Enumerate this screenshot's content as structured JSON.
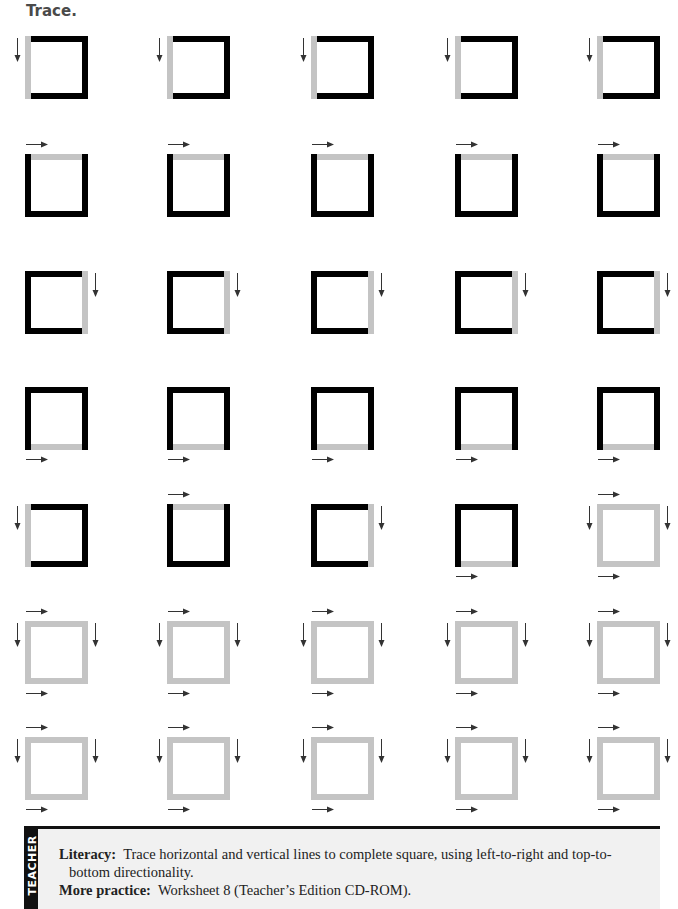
{
  "worksheet": {
    "title": "Trace."
  },
  "colors": {
    "solid_line": "#000000",
    "trace_line": "#c4c4c4",
    "teacher_panel": "#f1f1f1"
  },
  "grid": {
    "columns_x": [
      25,
      167,
      311,
      455,
      597
    ],
    "rows_y": [
      36,
      154,
      271,
      387,
      504,
      621,
      737
    ],
    "rows": [
      {
        "trace_sides": [
          "left"
        ],
        "arrows": [
          "left"
        ]
      },
      {
        "trace_sides": [
          "top"
        ],
        "arrows": [
          "top"
        ]
      },
      {
        "trace_sides": [
          "right"
        ],
        "arrows": [
          "right"
        ]
      },
      {
        "trace_sides": [
          "bottom"
        ],
        "arrows": [
          "bottom"
        ]
      },
      {
        "mixed": [
          {
            "trace_sides": [
              "left"
            ],
            "arrows": [
              "left"
            ]
          },
          {
            "trace_sides": [
              "top"
            ],
            "arrows": [
              "top"
            ]
          },
          {
            "trace_sides": [
              "right"
            ],
            "arrows": [
              "right"
            ]
          },
          {
            "trace_sides": [
              "bottom"
            ],
            "arrows": [
              "bottom"
            ]
          },
          {
            "trace_sides": [
              "top",
              "left",
              "right",
              "bottom"
            ],
            "arrows": [
              "top",
              "left",
              "right",
              "bottom"
            ]
          }
        ]
      },
      {
        "trace_sides": [
          "top",
          "left",
          "right",
          "bottom"
        ],
        "arrows": [
          "top",
          "left",
          "right",
          "bottom"
        ]
      },
      {
        "trace_sides": [
          "top",
          "left",
          "right",
          "bottom"
        ],
        "arrows": [
          "top",
          "left",
          "right",
          "bottom"
        ]
      }
    ]
  },
  "teacher_note": {
    "tab_label": "TEACHER",
    "literacy_label": "Literacy:",
    "literacy_text": "Trace horizontal and vertical lines to complete square, using left-to-right and top-to-",
    "literacy_text_cont": "bottom directionality.",
    "practice_label": "More practice:",
    "practice_text": "Worksheet 8 (Teacher’s Edition CD-ROM)."
  }
}
